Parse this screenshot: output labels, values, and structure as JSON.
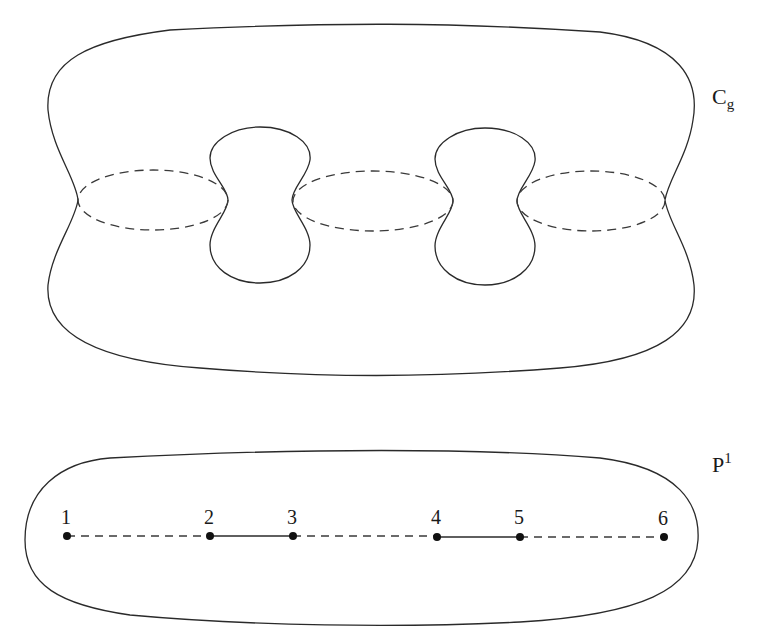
{
  "figure": {
    "surface_label": {
      "base": "C",
      "subscript": "g"
    },
    "line_label": {
      "base": "P",
      "superscript": "1"
    },
    "points": [
      {
        "label": "1",
        "x": 67
      },
      {
        "label": "2",
        "x": 210
      },
      {
        "label": "3",
        "x": 293
      },
      {
        "label": "4",
        "x": 437
      },
      {
        "label": "5",
        "x": 520
      },
      {
        "label": "6",
        "x": 664
      }
    ],
    "segments": [
      {
        "from": "1",
        "to": "2",
        "style": "dashed"
      },
      {
        "from": "2",
        "to": "3",
        "style": "solid"
      },
      {
        "from": "3",
        "to": "4",
        "style": "dashed"
      },
      {
        "from": "4",
        "to": "5",
        "style": "solid"
      },
      {
        "from": "5",
        "to": "6",
        "style": "dashed"
      }
    ],
    "holes": 2,
    "dashed_cycles": 3
  },
  "colors": {
    "stroke": "#2a2a2a",
    "background": "#ffffff"
  }
}
